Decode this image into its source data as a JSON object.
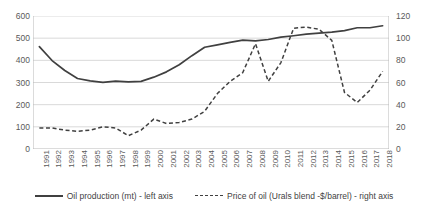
{
  "chart_data": {
    "type": "line",
    "title": "",
    "xlabel": "",
    "ylabel": "",
    "grid": true,
    "legend_position": "bottom",
    "x": [
      1991,
      1992,
      1993,
      1994,
      1995,
      1996,
      1997,
      1998,
      1999,
      2000,
      2001,
      2002,
      2003,
      2004,
      2005,
      2006,
      2007,
      2008,
      2009,
      2010,
      2011,
      2012,
      2013,
      2014,
      2015,
      2016,
      2017,
      2018
    ],
    "left_axis": {
      "label": "Oil production (mt)",
      "ticks": [
        0,
        100,
        200,
        300,
        400,
        500,
        600
      ],
      "ylim": [
        0,
        600
      ]
    },
    "right_axis": {
      "label": "Price of oil (Urals blend -$/barrel)",
      "ticks": [
        0,
        20,
        40,
        60,
        80,
        100,
        120
      ],
      "ylim": [
        0,
        120
      ]
    },
    "series": [
      {
        "name": "Oil production (mt) - left axis",
        "axis": "left",
        "style": "solid",
        "color": "#404040",
        "values": [
          462,
          399,
          354,
          318,
          307,
          301,
          306,
          303,
          305,
          324,
          348,
          380,
          421,
          459,
          470,
          481,
          491,
          488,
          494,
          505,
          511,
          518,
          523,
          527,
          534,
          547,
          547,
          556
        ]
      },
      {
        "name": "Price of oil (Urals blend -$/barrel) - right axis",
        "axis": "right",
        "style": "dashed",
        "color": "#404040",
        "values": [
          19,
          19,
          17,
          16,
          17,
          20,
          19,
          12,
          17,
          27,
          23,
          24,
          27,
          34,
          50,
          61,
          69,
          95,
          61,
          78,
          109,
          110,
          108,
          98,
          51,
          42,
          53,
          70
        ]
      }
    ]
  },
  "axes": {
    "left_tick_labels": [
      "600",
      "500",
      "400",
      "300",
      "200",
      "100",
      "0"
    ],
    "right_tick_labels": [
      "120",
      "100",
      "80",
      "60",
      "40",
      "20",
      "0"
    ],
    "x_tick_labels": [
      "1991",
      "1992",
      "1993",
      "1994",
      "1995",
      "1996",
      "1997",
      "1998",
      "1999",
      "2000",
      "2001",
      "2002",
      "2003",
      "2004",
      "2005",
      "2006",
      "2007",
      "2008",
      "2009",
      "2010",
      "2011",
      "2012",
      "2013",
      "2014",
      "2015",
      "2016",
      "2017",
      "2018"
    ]
  },
  "legend": {
    "items": [
      {
        "label": "Oil production (mt) - left axis",
        "style": "solid"
      },
      {
        "label": "Price of oil (Urals blend -$/barrel) - right axis",
        "style": "dashed"
      }
    ]
  },
  "cropped_header": ""
}
